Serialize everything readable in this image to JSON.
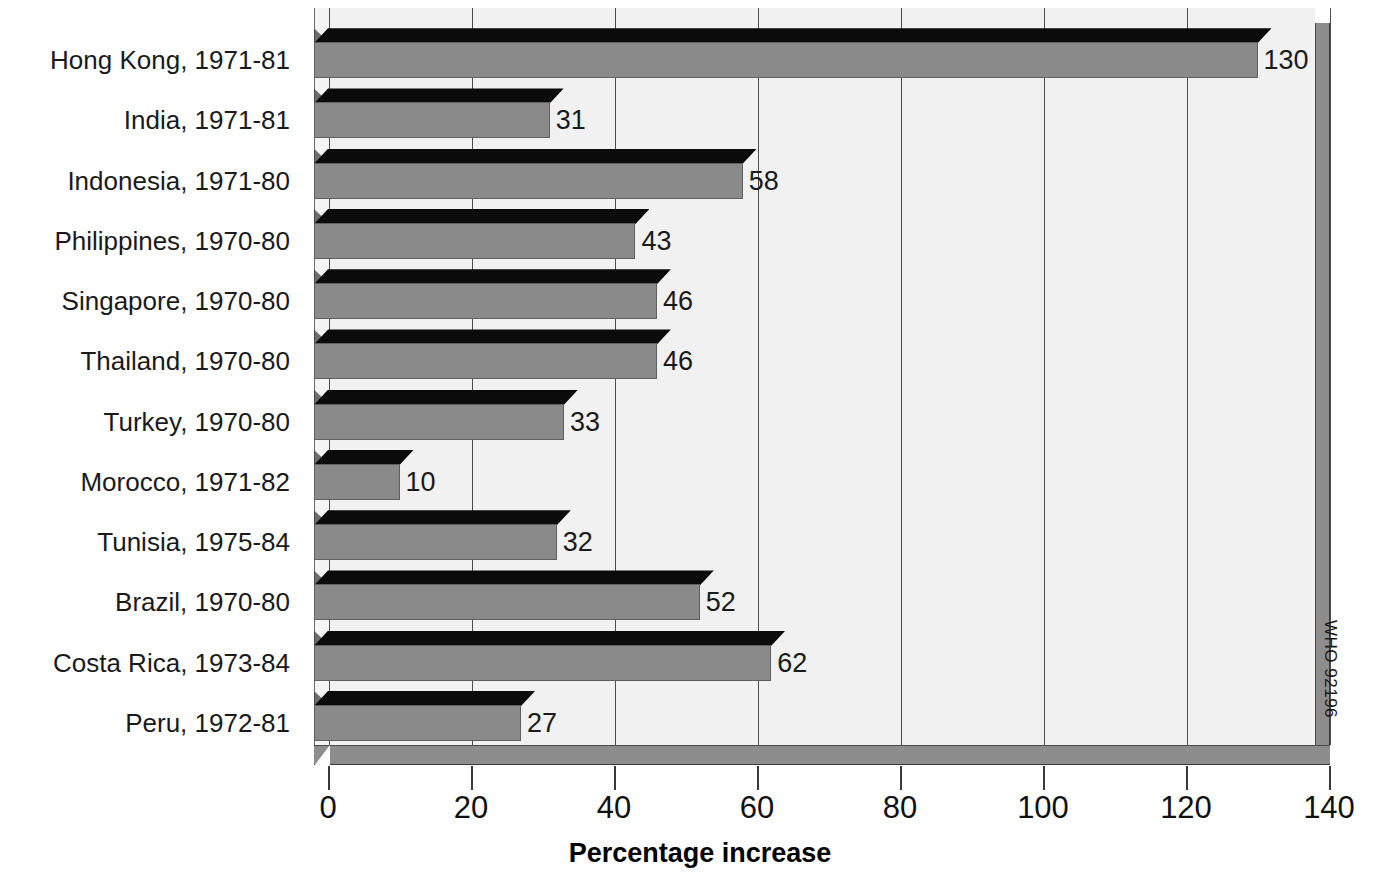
{
  "chart_data": {
    "type": "bar",
    "orientation": "horizontal",
    "title": "",
    "xlabel": "Percentage increase",
    "ylabel": "",
    "xlim": [
      0,
      140
    ],
    "xticks": [
      0,
      20,
      40,
      60,
      80,
      100,
      120,
      140
    ],
    "xtick_labels": [
      "0",
      "20",
      "40",
      "60",
      "80",
      "100",
      "120",
      "140"
    ],
    "grid": true,
    "grid_axis": "x",
    "legend": false,
    "categories": [
      "Hong Kong, 1971-81",
      "India, 1971-81",
      "Indonesia, 1971-80",
      "Philippines, 1970-80",
      "Singapore, 1970-80",
      "Thailand, 1970-80",
      "Turkey, 1970-80",
      "Morocco, 1971-82",
      "Tunisia, 1975-84",
      "Brazil, 1970-80",
      "Costa Rica, 1973-84",
      "Peru, 1972-81"
    ],
    "values": [
      130,
      31,
      58,
      43,
      46,
      46,
      33,
      10,
      32,
      52,
      62,
      27
    ],
    "value_labels": [
      "130",
      "31",
      "58",
      "43",
      "46",
      "46",
      "33",
      "10",
      "32",
      "52",
      "62",
      "27"
    ],
    "style": {
      "three_d": true,
      "bar_face_color": "#8a8a8a",
      "bar_top_color": "#0b0b0b",
      "bar_side_color": "#6d6d6d",
      "panel_color": "#f1f1f1",
      "floor_color": "#8d8d8d",
      "gridline_color": "#4d4d4d",
      "text_color": "#1a1a1a"
    }
  },
  "credit": {
    "text": "WHO 92196"
  }
}
